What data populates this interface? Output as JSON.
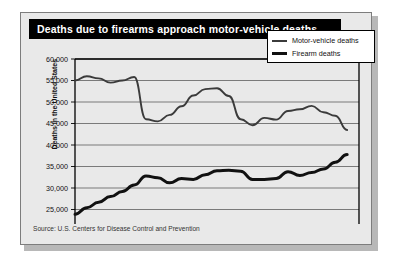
{
  "title": "Deaths due to firearms approach motor-vehicle deaths.",
  "source": "Source: U.S. Centers for Disease Control and Prevention",
  "y_axis_title": "Deaths in the United States",
  "legend": {
    "items": [
      {
        "label": "Motor-vehicle deaths",
        "color": "#3b3b3b",
        "weight": "thin"
      },
      {
        "label": "Firearm deaths",
        "color": "#111111",
        "weight": "thick"
      }
    ]
  },
  "chart_data": {
    "type": "line",
    "title": "Deaths due to firearms approach motor-vehicle deaths.",
    "xlabel": "",
    "ylabel": "Deaths in the United States",
    "xlim": [
      1968,
      1992
    ],
    "ylim": [
      20000,
      60000
    ],
    "grid": true,
    "legend_position": "top-right",
    "ytick_labels": [
      "60,000",
      "55,000",
      "50,000",
      "45,000",
      "40,000",
      "35,000",
      "30,000",
      "25,000",
      "20,000"
    ],
    "ytick_values": [
      60000,
      55000,
      50000,
      45000,
      40000,
      35000,
      30000,
      25000,
      20000
    ],
    "xtick_labels": [
      "1968",
      "1970",
      "1972",
      "1974",
      "1976",
      "1978",
      "1980",
      "1982",
      "1984",
      "1986",
      "1988",
      "1990",
      "1992"
    ],
    "xtick_values": [
      1968,
      1970,
      1972,
      1974,
      1976,
      1978,
      1980,
      1982,
      1984,
      1986,
      1988,
      1990,
      1992
    ],
    "x": [
      1968,
      1969,
      1970,
      1971,
      1972,
      1973,
      1974,
      1975,
      1976,
      1977,
      1978,
      1979,
      1980,
      1981,
      1982,
      1983,
      1984,
      1985,
      1986,
      1987,
      1988,
      1989,
      1990,
      1991
    ],
    "series": [
      {
        "name": "Motor-vehicle deaths",
        "color": "#3b3b3b",
        "values": [
          55000,
          56000,
          55500,
          54500,
          55000,
          55800,
          46000,
          45500,
          47000,
          49000,
          51500,
          53000,
          53200,
          51400,
          46000,
          44600,
          46300,
          45900,
          47900,
          48300,
          49100,
          47600,
          46800,
          43500
        ]
      },
      {
        "name": "Firearm deaths",
        "color": "#111111",
        "values": [
          23900,
          25400,
          26700,
          28000,
          29200,
          30700,
          32800,
          32400,
          31200,
          32200,
          32000,
          33100,
          34000,
          34100,
          33900,
          32000,
          32000,
          32200,
          33800,
          32900,
          33600,
          34400,
          36000,
          37800
        ]
      }
    ]
  }
}
